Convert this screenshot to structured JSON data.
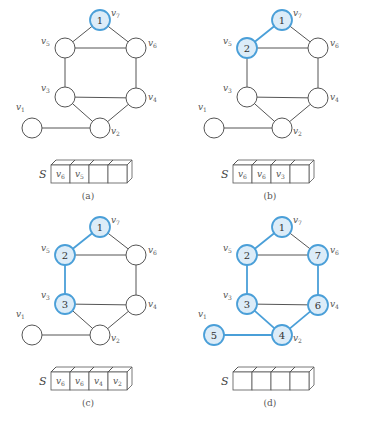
{
  "figure": {
    "node_radius": 10,
    "colors": {
      "highlight_stroke": "#4a9fd8",
      "highlight_fill": "#dcecf8",
      "normal_stroke": "#555555"
    },
    "vertices": [
      {
        "id": "v1",
        "label": "v",
        "sub": "1",
        "x": 32,
        "y": 128,
        "lx": -16,
        "ly": -18
      },
      {
        "id": "v2",
        "label": "v",
        "sub": "2",
        "x": 100,
        "y": 128,
        "lx": 11,
        "ly": 6
      },
      {
        "id": "v3",
        "label": "v",
        "sub": "3",
        "x": 65,
        "y": 97,
        "lx": -24,
        "ly": -6
      },
      {
        "id": "v4",
        "label": "v",
        "sub": "4",
        "x": 136,
        "y": 98,
        "lx": 12,
        "ly": 2
      },
      {
        "id": "v5",
        "label": "v",
        "sub": "5",
        "x": 65,
        "y": 48,
        "lx": -24,
        "ly": -4
      },
      {
        "id": "v6",
        "label": "v",
        "sub": "6",
        "x": 136,
        "y": 48,
        "lx": 12,
        "ly": -2
      },
      {
        "id": "v7",
        "label": "v",
        "sub": "7",
        "x": 100,
        "y": 20,
        "lx": 11,
        "ly": -4
      }
    ],
    "edges": [
      [
        "v7",
        "v5"
      ],
      [
        "v7",
        "v6"
      ],
      [
        "v5",
        "v6"
      ],
      [
        "v5",
        "v3"
      ],
      [
        "v6",
        "v4"
      ],
      [
        "v3",
        "v4"
      ],
      [
        "v3",
        "v2"
      ],
      [
        "v4",
        "v2"
      ],
      [
        "v1",
        "v2"
      ]
    ],
    "panels": [
      {
        "caption": "(a)",
        "offset": [
          0,
          0
        ],
        "visit_order": {
          "v7": "1"
        },
        "highlight_edges": [],
        "stack_label": "S",
        "stack": [
          "v6",
          "v5",
          "",
          ""
        ]
      },
      {
        "caption": "(b)",
        "offset": [
          182,
          0
        ],
        "visit_order": {
          "v7": "1",
          "v5": "2"
        },
        "highlight_edges": [
          [
            "v7",
            "v5"
          ]
        ],
        "stack_label": "S",
        "stack": [
          "v6",
          "v6",
          "v3",
          ""
        ]
      },
      {
        "caption": "(c)",
        "offset": [
          0,
          207
        ],
        "visit_order": {
          "v7": "1",
          "v5": "2",
          "v3": "3"
        },
        "highlight_edges": [
          [
            "v7",
            "v5"
          ],
          [
            "v5",
            "v3"
          ]
        ],
        "stack_label": "S",
        "stack": [
          "v6",
          "v6",
          "v4",
          "v2"
        ]
      },
      {
        "caption": "(d)",
        "offset": [
          182,
          207
        ],
        "visit_order": {
          "v7": "1",
          "v5": "2",
          "v3": "3",
          "v2": "4",
          "v1": "5",
          "v4": "6",
          "v6": "7"
        },
        "highlight_edges": [
          [
            "v7",
            "v5"
          ],
          [
            "v5",
            "v3"
          ],
          [
            "v3",
            "v2"
          ],
          [
            "v2",
            "v1"
          ],
          [
            "v2",
            "v4"
          ],
          [
            "v4",
            "v6"
          ]
        ],
        "stack_label": "S",
        "stack": [
          "",
          "",
          "",
          ""
        ]
      }
    ]
  }
}
